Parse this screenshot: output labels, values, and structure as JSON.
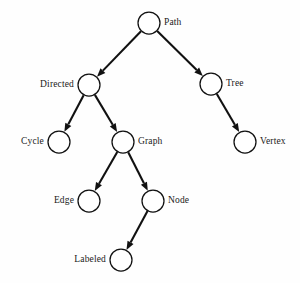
{
  "diagram": {
    "type": "directed-graph",
    "title": "",
    "background_color": "#fefefe",
    "node_fill_color": "#ffffff",
    "node_stroke_color": "#111111",
    "edge_color": "#111111",
    "label_color": "#1a1a1a",
    "node_radius": 11,
    "nodes": [
      {
        "id": "path",
        "label": "Path",
        "cx": 149,
        "cy": 23,
        "label_side": "right"
      },
      {
        "id": "directed",
        "label": "Directed",
        "cx": 89,
        "cy": 85,
        "label_side": "left"
      },
      {
        "id": "tree",
        "label": "Tree",
        "cx": 211,
        "cy": 84,
        "label_side": "right"
      },
      {
        "id": "cycle",
        "label": "Cycle",
        "cx": 59,
        "cy": 142,
        "label_side": "left"
      },
      {
        "id": "graph",
        "label": "Graph",
        "cx": 123,
        "cy": 142,
        "label_side": "right"
      },
      {
        "id": "vertex",
        "label": "Vertex",
        "cx": 245,
        "cy": 142,
        "label_side": "right"
      },
      {
        "id": "edge",
        "label": "Edge",
        "cx": 89,
        "cy": 201,
        "label_side": "left"
      },
      {
        "id": "node",
        "label": "Node",
        "cx": 153,
        "cy": 201,
        "label_side": "right"
      },
      {
        "id": "labeled",
        "label": "Labeled",
        "cx": 121,
        "cy": 260,
        "label_side": "left"
      }
    ],
    "edges": [
      {
        "id": "path-directed",
        "from": "path",
        "to": "directed",
        "directed": true
      },
      {
        "id": "path-tree",
        "from": "path",
        "to": "tree",
        "directed": true
      },
      {
        "id": "directed-cycle",
        "from": "directed",
        "to": "cycle",
        "directed": true
      },
      {
        "id": "directed-graph",
        "from": "directed",
        "to": "graph",
        "directed": true
      },
      {
        "id": "tree-vertex",
        "from": "tree",
        "to": "vertex",
        "directed": true
      },
      {
        "id": "graph-edge",
        "from": "graph",
        "to": "edge",
        "directed": true
      },
      {
        "id": "graph-node",
        "from": "graph",
        "to": "node",
        "directed": true
      },
      {
        "id": "node-labeled",
        "from": "node",
        "to": "labeled",
        "directed": true
      }
    ]
  }
}
